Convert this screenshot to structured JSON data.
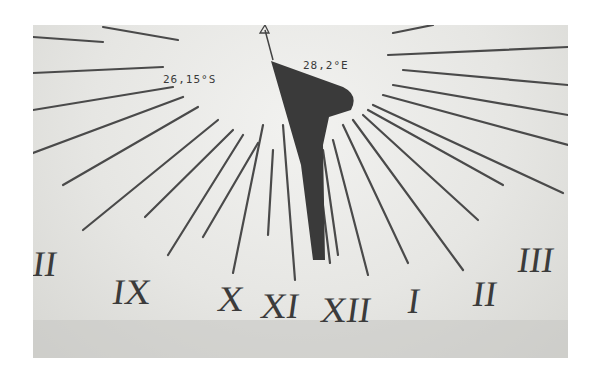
{
  "photo": {
    "subject": "sundial",
    "latitude_label": "26,15°S",
    "longitude_label": "28,2°E",
    "hour_numerals": [
      {
        "label": "II",
        "x": 0,
        "y": 222
      },
      {
        "label": "IX",
        "x": 80,
        "y": 248
      },
      {
        "label": "X",
        "x": 185,
        "y": 255
      },
      {
        "label": "XI",
        "x": 228,
        "y": 262
      },
      {
        "label": "XII",
        "x": 287,
        "y": 265
      },
      {
        "label": "I",
        "x": 375,
        "y": 258
      },
      {
        "label": "II",
        "x": 440,
        "y": 250
      },
      {
        "label": "III",
        "x": 485,
        "y": 218
      }
    ]
  }
}
